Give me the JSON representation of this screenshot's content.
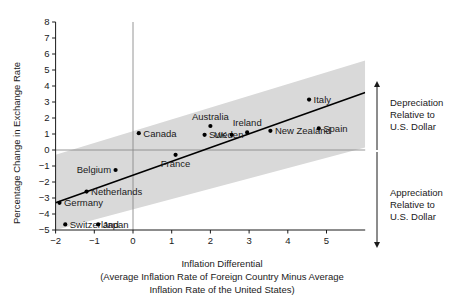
{
  "chart_data": {
    "type": "scatter",
    "title": "",
    "xlabel": "Inflation Differential",
    "xlabel_sub1": "(Average Inflation Rate of Foreign Country Minus Average",
    "xlabel_sub2": "Inflation Rate of the United States)",
    "ylabel": "Percentage Change in Exchange Rate",
    "xlim": [
      -2,
      6
    ],
    "ylim": [
      -5,
      8
    ],
    "xticks": [
      -2,
      -1,
      0,
      1,
      2,
      3,
      4,
      5
    ],
    "xtick_labels": [
      "−2",
      "−1",
      "0",
      "1",
      "2",
      "3",
      "4",
      "5"
    ],
    "yticks": [
      -5,
      -4,
      -3,
      -2,
      -1,
      0,
      1,
      2,
      3,
      4,
      5,
      6,
      7,
      8
    ],
    "ytick_labels": [
      "−5",
      "−4",
      "−3",
      "−2",
      "−1",
      "0",
      "1",
      "2",
      "3",
      "4",
      "5",
      "6",
      "7",
      "8"
    ],
    "grid": false,
    "zero_lines": true,
    "points": [
      {
        "label": "Canada",
        "x": 0.15,
        "y": 1.05,
        "label_pos": "right"
      },
      {
        "label": "Australia",
        "x": 2.0,
        "y": 1.5,
        "label_pos": "above"
      },
      {
        "label": "Sweden",
        "x": 1.85,
        "y": 0.95,
        "label_pos": "right"
      },
      {
        "label": "UK",
        "x": 2.55,
        "y": 0.95,
        "label_pos": "left"
      },
      {
        "label": "Ireland",
        "x": 2.95,
        "y": 1.1,
        "label_pos": "above"
      },
      {
        "label": "New Zealand",
        "x": 3.55,
        "y": 1.2,
        "label_pos": "right"
      },
      {
        "label": "Spain",
        "x": 4.8,
        "y": 1.35,
        "label_pos": "right"
      },
      {
        "label": "Italy",
        "x": 4.55,
        "y": 3.15,
        "label_pos": "right"
      },
      {
        "label": "France",
        "x": 1.1,
        "y": -0.3,
        "label_pos": "below"
      },
      {
        "label": "Belgium",
        "x": -0.45,
        "y": -1.25,
        "label_pos": "left"
      },
      {
        "label": "Netherlands",
        "x": -1.2,
        "y": -2.6,
        "label_pos": "right"
      },
      {
        "label": "Germany",
        "x": -1.9,
        "y": -3.3,
        "label_pos": "right"
      },
      {
        "label": "Switzerland",
        "x": -1.75,
        "y": -4.65,
        "label_pos": "right"
      },
      {
        "label": "Japan",
        "x": -0.9,
        "y": -4.65,
        "label_pos": "right"
      }
    ],
    "regression_line": {
      "x1": -2.0,
      "y1": -3.3,
      "x2": 6.0,
      "y2": 3.6,
      "color": "#000000"
    },
    "shaded_band": {
      "color": "#d9d9d9",
      "upper": [
        {
          "x": -2.0,
          "y": -0.3
        },
        {
          "x": 6.0,
          "y": 5.6
        }
      ],
      "lower": [
        {
          "x": -2.0,
          "y": -5.0
        },
        {
          "x": 6.0,
          "y": 0.15
        }
      ]
    },
    "annotations": [
      {
        "name": "depreciation",
        "lines": [
          "Depreciation",
          "Relative to",
          "U.S. Dollar"
        ],
        "region": "upper"
      },
      {
        "name": "appreciation",
        "lines": [
          "Appreciation",
          "Relative to",
          "U.S. Dollar"
        ],
        "region": "lower"
      }
    ],
    "colors": {
      "band": "#d9d9d9",
      "axis": "#1a1a1a",
      "point": "#000000",
      "zero_line": "#8a8a8a"
    }
  }
}
